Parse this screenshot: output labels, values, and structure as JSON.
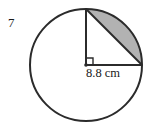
{
  "problem": {
    "number": "7"
  },
  "figure": {
    "type": "circle-with-shaded-segment",
    "shape_name": "circle",
    "dimension_label": "8.8 cm",
    "dimension_value": 8.8,
    "dimension_unit": "cm",
    "dimension_of": "radius",
    "center_angle_degrees": 90,
    "right_angle_marker": true,
    "shaded_region": "circular-segment-upper-right",
    "colors": {
      "outline": "#2b2b2b",
      "shaded_fill": "#b2b2b2",
      "background": "#ffffff",
      "text": "#1a1a1a"
    },
    "geometry": {
      "center_x": 86,
      "center_y": 65,
      "radius_px": 56,
      "top_point_x": 86,
      "top_point_y": 9,
      "right_point_x": 142,
      "right_point_y": 65
    }
  }
}
